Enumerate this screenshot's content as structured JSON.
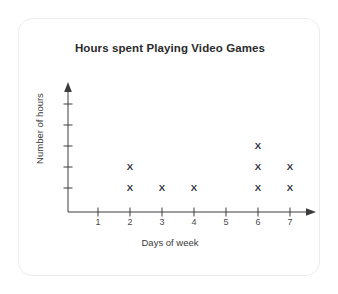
{
  "chart_data": {
    "type": "scatter",
    "title": "Hours spent Playing Video Games",
    "xlabel": "Days of week",
    "ylabel": "Number of hours",
    "categories": [
      "1",
      "2",
      "3",
      "4",
      "5",
      "6",
      "7"
    ],
    "values": [
      0,
      2,
      1,
      1,
      0,
      3,
      2
    ],
    "marker": "X",
    "xlim": [
      0,
      7
    ],
    "ylim": [
      0,
      5
    ],
    "x_tick_labels": [
      "1",
      "2",
      "3",
      "4",
      "5",
      "6",
      "7"
    ],
    "y_tick_labels": [
      "",
      "",
      "",
      "",
      ""
    ],
    "y_tick_count": 5,
    "grid": false,
    "legend": false,
    "axis_arrows": true,
    "points": [
      {
        "x": "2",
        "y": 1
      },
      {
        "x": "2",
        "y": 2
      },
      {
        "x": "3",
        "y": 1
      },
      {
        "x": "4",
        "y": 1
      },
      {
        "x": "6",
        "y": 1
      },
      {
        "x": "6",
        "y": 2
      },
      {
        "x": "6",
        "y": 3
      },
      {
        "x": "7",
        "y": 1
      },
      {
        "x": "7",
        "y": 2
      }
    ]
  },
  "colors": {
    "card_background": "#ffffff",
    "card_border": "#ececec",
    "title_text": "#2b2b2b",
    "axis_line": "#3c3c3c",
    "axis_label_text": "#3a3a3a",
    "tick_label_text": "#4a4a4a",
    "marker": "#33333a",
    "page_background": "#ffffff"
  }
}
